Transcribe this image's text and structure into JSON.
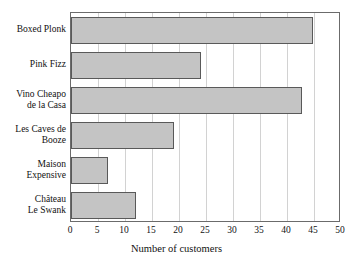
{
  "chart_data": {
    "type": "bar",
    "orientation": "horizontal",
    "title": "",
    "xlabel": "Number of customers",
    "ylabel": "",
    "xlim": [
      0,
      50
    ],
    "xticks": [
      0,
      5,
      10,
      15,
      20,
      25,
      30,
      35,
      40,
      45,
      50
    ],
    "xticklabels": [
      "0",
      "5",
      "10",
      "15",
      "20",
      "25",
      "30",
      "35",
      "40",
      "45",
      "50"
    ],
    "grid": "vertical",
    "legend": "none",
    "categories": [
      "Boxed Plonk",
      "Pink Fizz",
      "Vino Cheapo de la Casa",
      "Les Caves de Booze",
      "Maison Expensive",
      "Château Le Swank"
    ],
    "category_label_lines": [
      [
        "Boxed Plonk"
      ],
      [
        "Pink Fizz"
      ],
      [
        "Vino Cheapo",
        "de la Casa"
      ],
      [
        "Les Caves de",
        "Booze"
      ],
      [
        "Maison",
        "Expensive"
      ],
      [
        "Château",
        "Le Swank"
      ]
    ],
    "values": [
      44.8,
      24,
      42.8,
      19,
      6.8,
      12
    ],
    "bar_fill": "#c4c4c4",
    "bar_edge": "#595959",
    "grid_color": "#d2d2d2",
    "frame_color": "#6b6b6b",
    "background": "#ffffff"
  }
}
